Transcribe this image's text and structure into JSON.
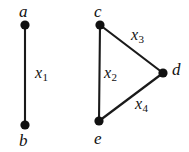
{
  "figure": {
    "type": "graph-diagram",
    "background_color": "#ffffff",
    "stroke_color": "#1a1a1a",
    "vertex_color": "#111111",
    "components": [
      {
        "name": "edge-component-ab",
        "vertices": [
          "a",
          "b"
        ],
        "edges": [
          "x1"
        ]
      },
      {
        "name": "triangle-component-cde",
        "vertices": [
          "c",
          "d",
          "e"
        ],
        "edges": [
          "x2",
          "x3",
          "x4"
        ]
      }
    ]
  },
  "vertices": [
    {
      "id": "a",
      "label": "a",
      "cx": 25,
      "cy": 25,
      "r": 4.6,
      "label_x": 19,
      "label_y": 3
    },
    {
      "id": "b",
      "label": "b",
      "cx": 25,
      "cy": 125,
      "r": 4.6,
      "label_x": 19,
      "label_y": 132
    },
    {
      "id": "c",
      "label": "c",
      "cx": 100,
      "cy": 25,
      "r": 4.6,
      "label_x": 94,
      "label_y": 3
    },
    {
      "id": "d",
      "label": "d",
      "cx": 163,
      "cy": 73,
      "r": 4.6,
      "label_x": 172,
      "label_y": 61
    },
    {
      "id": "e",
      "label": "e",
      "cx": 99,
      "cy": 121,
      "r": 4.6,
      "label_x": 94,
      "label_y": 130
    }
  ],
  "edges": [
    {
      "id": "x1",
      "from": "a",
      "to": "b",
      "label_base": "x",
      "label_sub": "1",
      "label_x": 35,
      "label_y": 65
    },
    {
      "id": "x2",
      "from": "c",
      "to": "e",
      "label_base": "x",
      "label_sub": "2",
      "label_x": 104,
      "label_y": 65
    },
    {
      "id": "x3",
      "from": "c",
      "to": "d",
      "label_base": "x",
      "label_sub": "3",
      "label_x": 131,
      "label_y": 27
    },
    {
      "id": "x4",
      "from": "e",
      "to": "d",
      "label_base": "x",
      "label_sub": "4",
      "label_x": 135,
      "label_y": 96
    }
  ],
  "labels": {
    "a": "a",
    "b": "b",
    "c": "c",
    "d": "d",
    "e": "e",
    "x1_base": "x",
    "x1_sub": "1",
    "x2_base": "x",
    "x2_sub": "2",
    "x3_base": "x",
    "x3_sub": "3",
    "x4_base": "x",
    "x4_sub": "4"
  }
}
